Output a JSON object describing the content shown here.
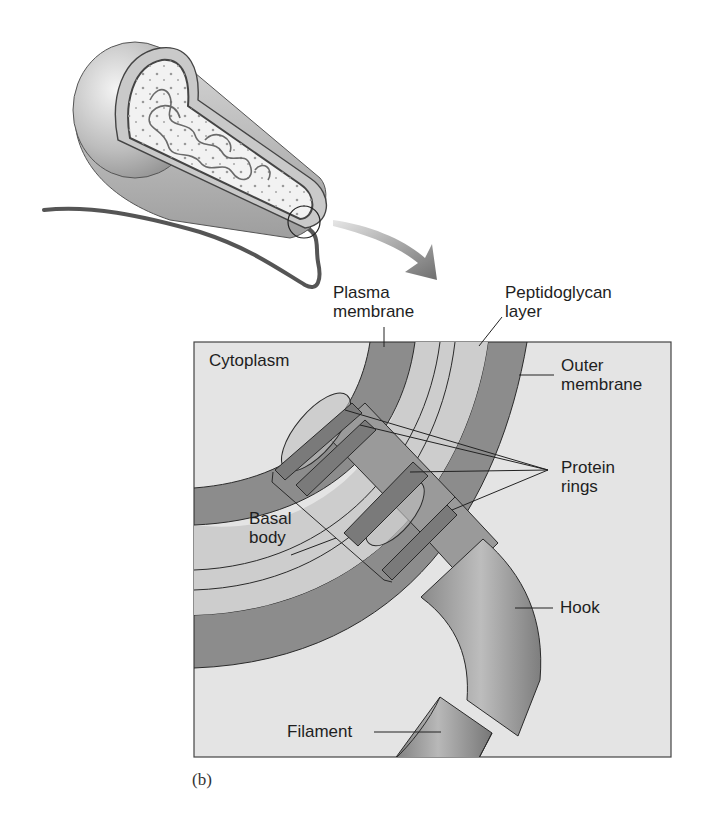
{
  "figure": {
    "panel_caption": "(b)"
  },
  "labels": {
    "plasma_membrane": "Plasma\nmembrane",
    "peptidoglycan": "Peptidoglycan\nlayer",
    "cytoplasm": "Cytoplasm",
    "outer_membrane": "Outer\nmembrane",
    "protein_rings": "Protein\nrings",
    "basal_body": "Basal\nbody",
    "hook": "Hook",
    "filament": "Filament"
  },
  "colors": {
    "box_background": "#e4e4e4",
    "membrane_dark": "#8c8c8c",
    "periplasm_light": "#cdcdcd",
    "ring_dark": "#7a7a7a",
    "hook_mid": "#9a9a9a",
    "outline": "#2a2a2a",
    "arrow": "#8a8a8a"
  }
}
